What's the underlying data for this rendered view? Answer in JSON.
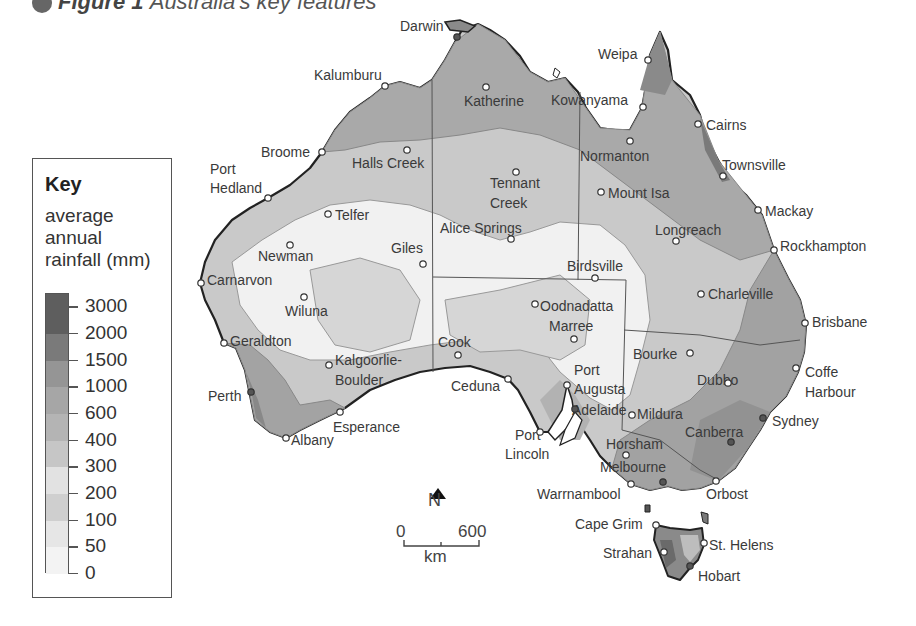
{
  "title": {
    "bullet": "●",
    "figure": "Figure 1",
    "caption": "Australia's key features"
  },
  "key": {
    "title": "Key",
    "subtitle_lines": [
      "average",
      "annual",
      "rainfall (mm)"
    ],
    "bands": [
      {
        "label": "3000",
        "color": "#5e5e5e"
      },
      {
        "label": "2000",
        "color": "#7a7a7a"
      },
      {
        "label": "1500",
        "color": "#959595"
      },
      {
        "label": "1000",
        "color": "#a6a6a6"
      },
      {
        "label": "600",
        "color": "#b4b4b4"
      },
      {
        "label": "400",
        "color": "#c6c6c6"
      },
      {
        "label": "300",
        "color": "#e2e2e2"
      },
      {
        "label": "200",
        "color": "#cfcfcf"
      },
      {
        "label": "100",
        "color": "#e6e6e6"
      },
      {
        "label": "50",
        "color": "#f3f3f3"
      },
      {
        "label": "0",
        "color": "#ffffff"
      }
    ]
  },
  "compass": {
    "label": "N"
  },
  "scale": {
    "start": "0",
    "end": "600",
    "unit": "km"
  },
  "places": [
    {
      "name": "Darwin",
      "x": 400,
      "y": 18,
      "dot": [
        457,
        37
      ],
      "capital": true
    },
    {
      "name": "Kalumburu",
      "x": 314,
      "y": 67,
      "dot": [
        385,
        86
      ]
    },
    {
      "name": "Katherine",
      "x": 464,
      "y": 93,
      "dot": [
        486,
        87
      ]
    },
    {
      "name": "Weipa",
      "x": 598,
      "y": 46,
      "dot": [
        648,
        60
      ]
    },
    {
      "name": "Kowanyama",
      "x": 551,
      "y": 92,
      "dot": [
        643,
        107
      ]
    },
    {
      "name": "Cairns",
      "x": 706,
      "y": 117,
      "dot": [
        698,
        124
      ]
    },
    {
      "name": "Broome",
      "x": 261,
      "y": 144,
      "dot": [
        322,
        152
      ]
    },
    {
      "name": "Halls Creek",
      "x": 352,
      "y": 155,
      "dot": [
        407,
        150
      ]
    },
    {
      "name": "Normanton",
      "x": 580,
      "y": 148,
      "dot": [
        630,
        141
      ]
    },
    {
      "name": "Townsville",
      "x": 722,
      "y": 157,
      "dot": [
        723,
        176
      ]
    },
    {
      "name": "Port",
      "x": 210,
      "y": 161
    },
    {
      "name": "Hedland",
      "x": 210,
      "y": 180,
      "dot": [
        268,
        198
      ]
    },
    {
      "name": "Tennant",
      "x": 490,
      "y": 175,
      "dot": [
        516,
        172
      ]
    },
    {
      "name": "Creek",
      "x": 490,
      "y": 195
    },
    {
      "name": "Mount Isa",
      "x": 608,
      "y": 185,
      "dot": [
        601,
        192
      ]
    },
    {
      "name": "Mackay",
      "x": 765,
      "y": 203,
      "dot": [
        758,
        210
      ]
    },
    {
      "name": "Telfer",
      "x": 335,
      "y": 207,
      "dot": [
        328,
        214
      ]
    },
    {
      "name": "Alice Springs",
      "x": 440,
      "y": 220,
      "dot": [
        511,
        239
      ]
    },
    {
      "name": "Longreach",
      "x": 655,
      "y": 222,
      "dot": [
        676,
        241
      ]
    },
    {
      "name": "Rockhampton",
      "x": 780,
      "y": 238,
      "dot": [
        774,
        250
      ]
    },
    {
      "name": "Newman",
      "x": 258,
      "y": 248,
      "dot": [
        290,
        245
      ]
    },
    {
      "name": "Giles",
      "x": 391,
      "y": 240,
      "dot": [
        423,
        264
      ]
    },
    {
      "name": "Birdsville",
      "x": 567,
      "y": 258,
      "dot": [
        595,
        278
      ]
    },
    {
      "name": "Carnarvon",
      "x": 207,
      "y": 272,
      "dot": [
        201,
        283
      ]
    },
    {
      "name": "Oodnadatta",
      "x": 540,
      "y": 298,
      "dot": [
        535,
        304
      ]
    },
    {
      "name": "Charleville",
      "x": 708,
      "y": 286,
      "dot": [
        701,
        294
      ]
    },
    {
      "name": "Wiluna",
      "x": 285,
      "y": 303,
      "dot": [
        304,
        297
      ]
    },
    {
      "name": "Brisbane",
      "x": 812,
      "y": 314,
      "dot": [
        805,
        323
      ]
    },
    {
      "name": "Marree",
      "x": 549,
      "y": 318,
      "dot": [
        574,
        339
      ]
    },
    {
      "name": "Geraldton",
      "x": 230,
      "y": 333,
      "dot": [
        224,
        343
      ]
    },
    {
      "name": "Bourke",
      "x": 633,
      "y": 346,
      "dot": [
        690,
        353
      ]
    },
    {
      "name": "Cook",
      "x": 438,
      "y": 334,
      "dot": [
        458,
        355
      ]
    },
    {
      "name": "Coffe",
      "x": 805,
      "y": 364,
      "dot": [
        796,
        368
      ]
    },
    {
      "name": "Harbour",
      "x": 805,
      "y": 384
    },
    {
      "name": "Kalgoorlie-",
      "x": 335,
      "y": 352,
      "dot": [
        329,
        365
      ]
    },
    {
      "name": "Boulder",
      "x": 335,
      "y": 372
    },
    {
      "name": "Port",
      "x": 574,
      "y": 362
    },
    {
      "name": "Dubbo",
      "x": 697,
      "y": 372,
      "dot": [
        728,
        383
      ]
    },
    {
      "name": "Ceduna",
      "x": 451,
      "y": 378,
      "dot": [
        508,
        379
      ]
    },
    {
      "name": "Augusta",
      "x": 574,
      "y": 381,
      "dot": [
        567,
        385
      ]
    },
    {
      "name": "Perth",
      "x": 208,
      "y": 388,
      "dot": [
        251,
        392
      ],
      "capital": true
    },
    {
      "name": "Adelaide",
      "x": 572,
      "y": 402,
      "dot": [
        575,
        409
      ],
      "capital": true
    },
    {
      "name": "Mildura",
      "x": 637,
      "y": 406,
      "dot": [
        632,
        415
      ]
    },
    {
      "name": "Sydney",
      "x": 772,
      "y": 413,
      "dot": [
        763,
        418
      ],
      "capital": true
    },
    {
      "name": "Esperance",
      "x": 333,
      "y": 419,
      "dot": [
        340,
        412
      ]
    },
    {
      "name": "Canberra",
      "x": 685,
      "y": 424,
      "dot": [
        731,
        442
      ],
      "capital": true
    },
    {
      "name": "Albany",
      "x": 291,
      "y": 432,
      "dot": [
        286,
        438
      ]
    },
    {
      "name": "Port",
      "x": 515,
      "y": 427,
      "dot": [
        540,
        432
      ]
    },
    {
      "name": "Horsham",
      "x": 606,
      "y": 436,
      "dot": [
        626,
        455
      ]
    },
    {
      "name": "Lincoln",
      "x": 505,
      "y": 446
    },
    {
      "name": "Melbourne",
      "x": 600,
      "y": 459,
      "dot": [
        663,
        482
      ],
      "capital": true
    },
    {
      "name": "Warrnambool",
      "x": 537,
      "y": 486,
      "dot": [
        631,
        484
      ]
    },
    {
      "name": "Orbost",
      "x": 706,
      "y": 486,
      "dot": [
        716,
        481
      ]
    },
    {
      "name": "Cape Grim",
      "x": 575,
      "y": 516,
      "dot": [
        656,
        525
      ]
    },
    {
      "name": "St. Helens",
      "x": 709,
      "y": 537,
      "dot": [
        704,
        543
      ]
    },
    {
      "name": "Strahan",
      "x": 603,
      "y": 545,
      "dot": [
        664,
        552
      ]
    },
    {
      "name": "Hobart",
      "x": 698,
      "y": 568,
      "dot": [
        690,
        566
      ],
      "capital": true
    }
  ]
}
